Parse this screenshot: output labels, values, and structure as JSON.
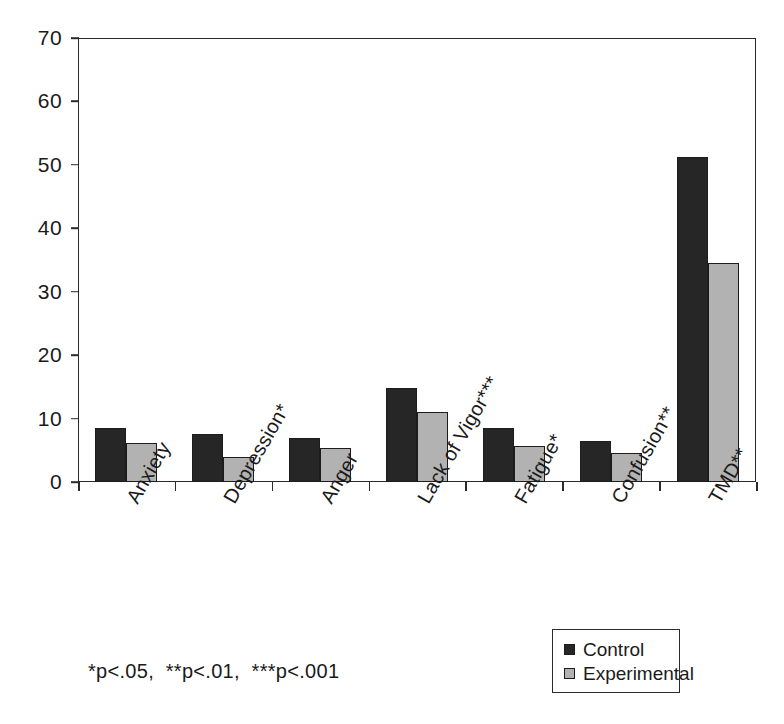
{
  "chart_data": {
    "type": "bar",
    "title": "",
    "xlabel": "",
    "ylabel": "",
    "ylim": [
      0,
      70
    ],
    "yticks": [
      0,
      10,
      20,
      30,
      40,
      50,
      60,
      70
    ],
    "grid": false,
    "legend_position": "bottom-right",
    "categories": [
      "Anxiety",
      "Depression*",
      "Anger",
      "Lack of Vigor***",
      "Fatigue*",
      "Confusion**",
      "TMD**"
    ],
    "series": [
      {
        "name": "Control",
        "color": "#262626",
        "values": [
          8.5,
          7.6,
          7.0,
          14.9,
          8.5,
          6.4,
          51.3
        ]
      },
      {
        "name": "Experimental",
        "color": "#b2b2b2",
        "values": [
          6.1,
          4.0,
          5.3,
          11.0,
          5.6,
          4.5,
          34.6
        ]
      }
    ],
    "annotations": [
      "*p<.05,  **p<.01,  ***p<.001"
    ]
  },
  "legend": {
    "items": [
      {
        "label": "Control"
      },
      {
        "label": "Experimental"
      }
    ]
  },
  "footnote": {
    "text": "*p<.05,  **p<.01,  ***p<.001"
  }
}
